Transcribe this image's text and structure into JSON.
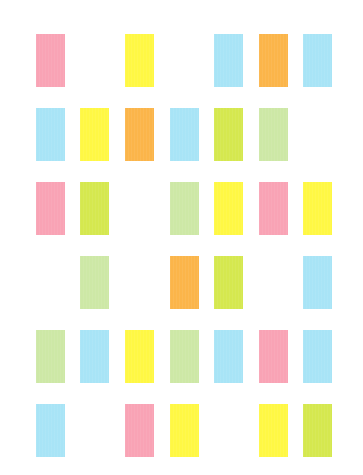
{
  "palette": {
    "pink": "#f9a3b5",
    "yellow": "#fff844",
    "orange": "#fbb54a",
    "blue": "#a8e4f6",
    "lime": "#d5e84f",
    "palegreen": "#cde8a6"
  },
  "layout": {
    "columns_x": [
      36,
      80,
      125,
      170,
      214,
      259,
      303
    ],
    "rows_y": [
      34,
      108,
      182,
      256,
      330,
      404
    ],
    "tile_width": 29,
    "tile_height": 53
  },
  "rows": [
    [
      "pink",
      null,
      "yellow",
      null,
      "blue",
      "orange",
      "blue"
    ],
    [
      "blue",
      "yellow",
      "orange",
      "blue",
      "lime",
      "palegreen",
      null
    ],
    [
      "pink",
      "lime",
      null,
      "palegreen",
      "yellow",
      "pink",
      "yellow"
    ],
    [
      null,
      "palegreen",
      null,
      "orange",
      "lime",
      null,
      "blue"
    ],
    [
      "palegreen",
      "blue",
      "yellow",
      "palegreen",
      "blue",
      "pink",
      "blue"
    ],
    [
      "blue",
      null,
      "pink",
      "yellow",
      null,
      "yellow",
      "lime"
    ]
  ]
}
